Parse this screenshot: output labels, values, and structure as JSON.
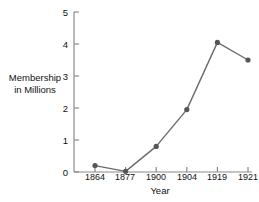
{
  "chart_data": {
    "type": "line",
    "title": "",
    "xlabel": "Year",
    "ylabel": "Membership in Millions",
    "ylabel_lines": [
      "Membership",
      "in Millions"
    ],
    "categories": [
      "1864",
      "1877",
      "1900",
      "1904",
      "1919",
      "1921"
    ],
    "values": [
      0.2,
      0.02,
      0.8,
      1.95,
      4.05,
      3.5
    ],
    "series": [
      {
        "name": "Membership",
        "values": [
          0.2,
          0.02,
          0.8,
          1.95,
          4.05,
          3.5
        ]
      }
    ],
    "yticks": [
      "0",
      "1",
      "2",
      "3",
      "4",
      "5"
    ],
    "ytick_values": [
      0,
      1,
      2,
      3,
      4,
      5
    ],
    "ylim": [
      0,
      5
    ],
    "grid": false,
    "legend": false,
    "marker": "circle",
    "line_color": "#6b6b6b",
    "marker_color": "#555555",
    "axis_color": "#8a8a8a",
    "text_color": "#111111",
    "background": "#ffffff"
  }
}
